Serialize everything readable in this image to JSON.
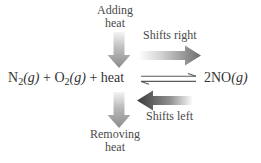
{
  "diagram": {
    "background_color": "#ffffff",
    "text_color": "#4a4a4a"
  },
  "equation": {
    "left_side": {
      "reactant_1_formula": "N",
      "reactant_1_subscript": "2",
      "reactant_1_state": "(g)",
      "plus_1": " + ",
      "reactant_2_formula": "O",
      "reactant_2_subscript": "2",
      "reactant_2_state": "(g)",
      "plus_2": " + ",
      "energy_term": "heat",
      "plain_text": "N2(g) + O2(g) + heat"
    },
    "right_side": {
      "coefficient": "2",
      "product_formula": "NO",
      "product_state": "(g)",
      "plain_text": "2NO(g)"
    },
    "arrow_type": "equilibrium-double-harpoon"
  },
  "labels": {
    "adding_heat_line1": "Adding",
    "adding_heat_line2": "heat",
    "removing_heat_line1": "Removing",
    "removing_heat_line2": "heat",
    "shifts_right": "Shifts right",
    "shifts_left": "Shifts left"
  },
  "arrows": {
    "adding_heat_arrow": {
      "name": "down-arrow-adding-heat",
      "direction": "down",
      "gradient_from": "#f2f2f2",
      "gradient_to": "#888888"
    },
    "removing_heat_arrow": {
      "name": "down-arrow-removing-heat",
      "direction": "down",
      "gradient_from": "#f2f2f2",
      "gradient_to": "#8a8a8a"
    },
    "shifts_right_arrow": {
      "name": "right-arrow-shifts-right",
      "direction": "right",
      "gradient_from": "#fbfbfb",
      "gradient_to": "#6e6e6e"
    },
    "shifts_left_arrow": {
      "name": "left-arrow-shifts-left",
      "direction": "left",
      "gradient_from": "#f8f8f8",
      "gradient_to": "#3c3c3c"
    },
    "equilibrium_arrow": {
      "name": "equilibrium-harpoons",
      "direction": "both",
      "color": "#555555"
    }
  }
}
